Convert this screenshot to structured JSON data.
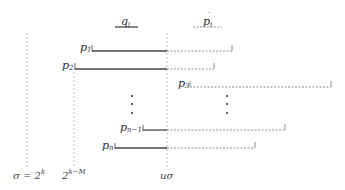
{
  "legend": {
    "solid_label": "q",
    "solid_sub": "i",
    "dashed_label": "p",
    "dashed_sub": "i",
    "dashed_prime": "′"
  },
  "rows": [
    {
      "label": "p",
      "sub": "1"
    },
    {
      "label": "p",
      "sub": "2"
    },
    {
      "label": "p",
      "sub": "3"
    },
    {
      "label": "p",
      "sub": "n−1"
    },
    {
      "label": "p",
      "sub": "n"
    }
  ],
  "axis": {
    "sigma_label": "σ = 2",
    "sigma_sup": "k",
    "mid_label": "2",
    "mid_sup": "k−M",
    "u_sigma_label": "uσ"
  },
  "colors": {
    "solid": "#444444",
    "dashed": "#777777",
    "guide": "#999999"
  }
}
